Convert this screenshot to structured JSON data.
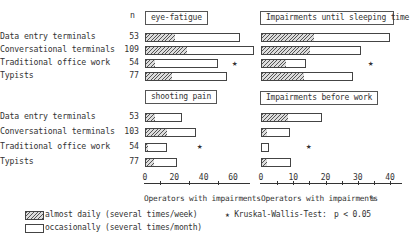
{
  "chart_data": [
    {
      "type": "bar",
      "orientation": "horizontal",
      "stacked_overlay": true,
      "title": "eye-fatigue",
      "categories": [
        "Data entry terminals",
        "Conversational terminals",
        "Traditional office work",
        "Typists"
      ],
      "n": [
        53,
        109,
        54,
        77
      ],
      "series": [
        {
          "name": "almost daily (several times/week)",
          "values": [
            20,
            28,
            6,
            18
          ]
        },
        {
          "name": "total incl. occasionally (several times/month)",
          "values": [
            65,
            74,
            50,
            56
          ]
        }
      ],
      "significant": [
        false,
        false,
        true,
        false
      ],
      "xlim": [
        0,
        65
      ],
      "xticks": [
        0,
        20,
        40,
        60
      ]
    },
    {
      "type": "bar",
      "orientation": "horizontal",
      "stacked_overlay": true,
      "title": "Impairments until sleeping time",
      "categories": [
        "Data entry terminals",
        "Conversational terminals",
        "Traditional office work",
        "Typists"
      ],
      "series": [
        {
          "name": "almost daily (several times/week)",
          "values": [
            16,
            15,
            7.5,
            13
          ]
        },
        {
          "name": "total incl. occasionally (several times/month)",
          "values": [
            40,
            31,
            14,
            28.5
          ]
        }
      ],
      "significant": [
        false,
        false,
        true,
        false
      ],
      "xlim": [
        0,
        45
      ],
      "xticks": [
        0,
        10,
        20,
        30,
        40
      ]
    },
    {
      "type": "bar",
      "orientation": "horizontal",
      "stacked_overlay": true,
      "title": "shooting pain",
      "categories": [
        "Data entry terminals",
        "Conversational terminals",
        "Traditional office work",
        "Typists"
      ],
      "n": [
        53,
        103,
        54,
        77
      ],
      "series": [
        {
          "name": "almost daily (several times/week)",
          "values": [
            6,
            14,
            1.5,
            5.5
          ]
        },
        {
          "name": "total incl. occasionally (several times/month)",
          "values": [
            25,
            35,
            15,
            22
          ]
        }
      ],
      "significant": [
        false,
        false,
        true,
        false
      ],
      "xlabel": "Operators with impairments",
      "xlim": [
        0,
        65
      ],
      "xticks": [
        0,
        20,
        40,
        60
      ]
    },
    {
      "type": "bar",
      "orientation": "horizontal",
      "stacked_overlay": true,
      "title": "Impairments before work",
      "categories": [
        "Data entry terminals",
        "Conversational terminals",
        "Traditional office work",
        "Typists"
      ],
      "series": [
        {
          "name": "almost daily (several times/week)",
          "values": [
            8,
            1.5,
            0,
            1.5
          ]
        },
        {
          "name": "total incl. occasionally (several times/month)",
          "values": [
            19,
            9,
            2.5,
            9.3
          ]
        }
      ],
      "significant": [
        false,
        false,
        true,
        false
      ],
      "xlabel": "Operators with impairments %",
      "xlim": [
        0,
        45
      ],
      "xticks": [
        0,
        10,
        20,
        30,
        40
      ]
    }
  ],
  "labels": {
    "n_header": "n",
    "groups": [
      "Data entry terminals",
      "Conversational terminals",
      "Traditional office work",
      "Typists"
    ],
    "n_top": [
      "53",
      "109",
      "54",
      "77"
    ],
    "n_bottom": [
      "53",
      "103",
      "54",
      "77"
    ],
    "panel_titles": {
      "top_left": "eye-fatigue",
      "top_right": "Impairments until sleeping time",
      "bottom_left": "shooting pain",
      "bottom_right": "Impairments before work"
    },
    "star": "★",
    "left_ticks": [
      "0",
      "20",
      "40",
      "60"
    ],
    "right_ticks": [
      "0",
      "10",
      "20",
      "30",
      "40"
    ],
    "left_axis_title": "Operators with impairments",
    "right_axis_title": "Operators with impairments",
    "right_axis_unit": "%"
  },
  "legend": {
    "hatched": "almost daily (several times/week)",
    "open": "occasionally (several times/month)",
    "significance": "★ Kruskal-Wallis-Test:",
    "p_value": "p < 0.05"
  }
}
